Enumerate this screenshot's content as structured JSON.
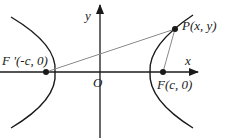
{
  "diagram": {
    "type": "hyperbola-foci",
    "axes": {
      "x_label": "x",
      "y_label": "y",
      "origin_label": "O"
    },
    "points": {
      "left_focus": "F '(-c, 0)",
      "right_focus": "F(c, 0)",
      "point_on_curve": "P(x, y)"
    },
    "colors": {
      "curve": "#1a1a1a",
      "axis": "#1a1a1a",
      "segment": "#8a8a8a"
    }
  }
}
